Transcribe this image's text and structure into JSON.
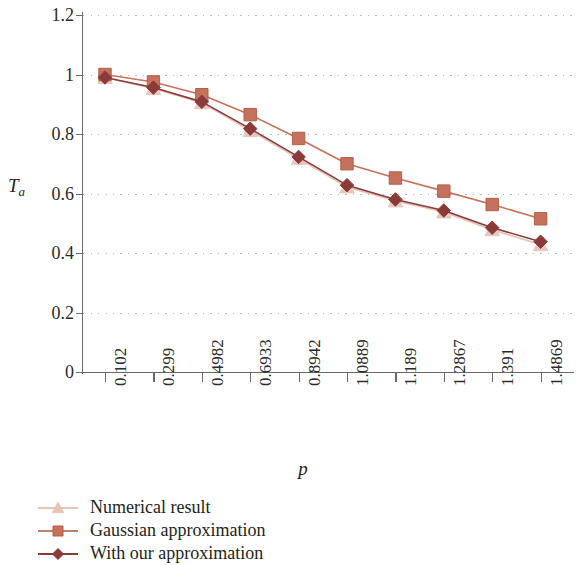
{
  "figure": {
    "background": "#ffffff",
    "axis_color": "#6a6a6a",
    "grid_color": "#b9b9b9",
    "text_color": "#231f20"
  },
  "axes": {
    "ylabel_main": "T",
    "ylabel_sub": "a",
    "xlabel": "p",
    "ytick_labels": [
      "1.2",
      "1",
      "0.8",
      "0.6",
      "0.4",
      "0.2",
      "0"
    ],
    "ytick_values": [
      1.2,
      1.0,
      0.8,
      0.6,
      0.4,
      0.2,
      0
    ]
  },
  "legend": {
    "items": [
      {
        "label": "Numerical result",
        "marker": "triangle-marker",
        "color": "#e8c4b8",
        "line_color": "#e8c4b8"
      },
      {
        "label": "Gaussian approximation",
        "marker": "square-marker",
        "color": "#c5715c",
        "line_color": "#c08070"
      },
      {
        "label": "With our approximation",
        "marker": "diamond-marker",
        "color": "#8b3a3a",
        "line_color": "#8b3a3a"
      }
    ]
  },
  "chart_data": {
    "type": "line",
    "title": "",
    "xlabel": "p",
    "ylabel": "T_a",
    "categories": [
      "0.102",
      "0.299",
      "0.4982",
      "0.6933",
      "0.8942",
      "1.0889",
      "1.189",
      "1.2867",
      "1.391",
      "1.4869"
    ],
    "x": [
      0.102,
      0.299,
      0.4982,
      0.6933,
      0.8942,
      1.0889,
      1.189,
      1.2867,
      1.391,
      1.4869
    ],
    "ylim": [
      0,
      1.2
    ],
    "ytick_step": 0.2,
    "grid": "horizontal-dotted",
    "legend_position": "below-axes-left",
    "series": [
      {
        "name": "Numerical result",
        "marker": "triangle",
        "color": "#e8c4b8",
        "values": [
          0.99,
          0.953,
          0.905,
          0.812,
          0.718,
          0.622,
          0.575,
          0.538,
          0.478,
          0.428
        ]
      },
      {
        "name": "Gaussian approximation",
        "marker": "square",
        "color": "#c5715c",
        "values": [
          1.0,
          0.975,
          0.932,
          0.865,
          0.785,
          0.7,
          0.652,
          0.608,
          0.563,
          0.515
        ]
      },
      {
        "name": "With our approximation",
        "marker": "diamond",
        "color": "#8b3a3a",
        "values": [
          0.99,
          0.956,
          0.908,
          0.818,
          0.723,
          0.628,
          0.58,
          0.543,
          0.485,
          0.438
        ]
      }
    ]
  }
}
